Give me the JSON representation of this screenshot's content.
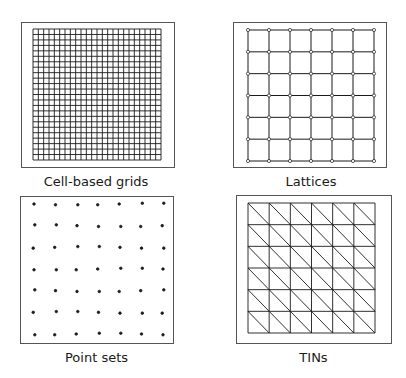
{
  "panels": [
    {
      "id": "cell-grids",
      "label": "Cell-based grids",
      "type": "raster-grid",
      "cells": 24
    },
    {
      "id": "lattices",
      "label": "Lattices",
      "type": "lattice",
      "nodes": 7
    },
    {
      "id": "point-sets",
      "label": "Point sets",
      "type": "points",
      "nodes": 7
    },
    {
      "id": "tins",
      "label": "TINs",
      "type": "tin",
      "cells": 6
    }
  ],
  "colors": {
    "line": "#1a1a1a",
    "frame": "#555555"
  }
}
